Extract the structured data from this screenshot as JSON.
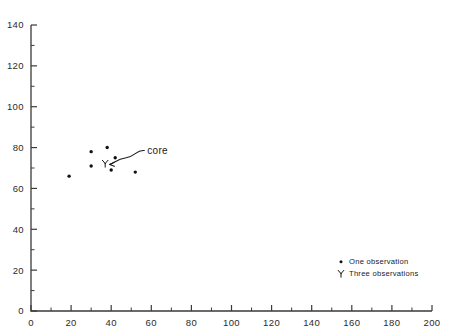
{
  "chart_data": {
    "type": "scatter",
    "title": "",
    "xlabel": "",
    "ylabel": "",
    "xlim": [
      0,
      200
    ],
    "ylim": [
      0,
      140
    ],
    "xticks": [
      0,
      20,
      40,
      60,
      80,
      100,
      120,
      140,
      160,
      180,
      200
    ],
    "xticklabels": [
      "0",
      "20",
      "40",
      "60",
      "80",
      "100",
      "120",
      "140",
      "160",
      "180",
      "200"
    ],
    "yticks": [
      0,
      20,
      40,
      60,
      80,
      100,
      120,
      140
    ],
    "yticklabels": [
      "0",
      "20",
      "40",
      "60",
      "80",
      "100",
      "120",
      "140"
    ],
    "x_minor_step": 10,
    "y_minor_step": 10,
    "grid": false,
    "legend_position": "lower-right",
    "series": [
      {
        "name": "One observation",
        "marker": "dot",
        "points": [
          {
            "x": 19,
            "y": 66
          },
          {
            "x": 30,
            "y": 78
          },
          {
            "x": 30,
            "y": 71
          },
          {
            "x": 38,
            "y": 80
          },
          {
            "x": 40,
            "y": 69
          },
          {
            "x": 42,
            "y": 75
          },
          {
            "x": 52,
            "y": 68
          }
        ]
      },
      {
        "name": "Three observations",
        "marker": "trident",
        "points": [
          {
            "x": 37,
            "y": 72
          }
        ]
      }
    ],
    "annotations": [
      {
        "text": "core",
        "label_x": 58,
        "label_y": 80,
        "target_x": 38,
        "target_y": 72,
        "leader": "curved"
      }
    ]
  },
  "legend": {
    "items": [
      {
        "label": "One observation",
        "marker": "dot"
      },
      {
        "label": "Three observations",
        "marker": "trident"
      }
    ]
  }
}
